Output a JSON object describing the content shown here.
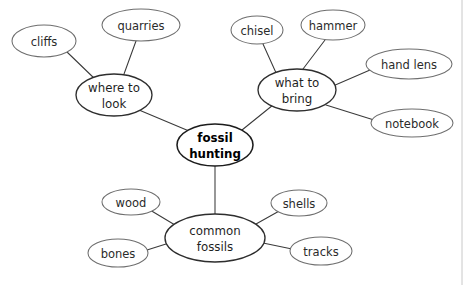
{
  "diagram": {
    "type": "mind-map",
    "title": "fossil hunting",
    "canvas": {
      "width": 471,
      "height": 285,
      "background": "#ffffff"
    },
    "styles": {
      "node_fill": "#ffffff",
      "leaf_stroke": "#6e6e6e",
      "branch_stroke": "#2e2e2e",
      "center_stroke": "#1c1c1c",
      "edge_stroke": "#3a3a3a",
      "text_color": "#1a1a1a",
      "frame_stroke": "#c8c8c8"
    },
    "center": {
      "id": "fossil-hunting",
      "label_line1": "fossil",
      "label_line2": "hunting",
      "cx": 215,
      "cy": 145,
      "rx": 38,
      "ry": 21
    },
    "branches": [
      {
        "id": "where-to-look",
        "label_line1": "where to",
        "label_line2": "look",
        "cx": 114,
        "cy": 95,
        "rx": 38,
        "ry": 21,
        "children": [
          {
            "id": "cliffs",
            "label": "cliffs",
            "cx": 44,
            "cy": 41,
            "rx": 32,
            "ry": 16
          },
          {
            "id": "quarries",
            "label": "quarries",
            "cx": 141,
            "cy": 25,
            "rx": 39,
            "ry": 16
          }
        ]
      },
      {
        "id": "what-to-bring",
        "label_line1": "what to",
        "label_line2": "bring",
        "cx": 297,
        "cy": 90,
        "rx": 39,
        "ry": 21,
        "children": [
          {
            "id": "chisel",
            "label": "chisel",
            "cx": 257,
            "cy": 30,
            "rx": 26,
            "ry": 14
          },
          {
            "id": "hammer",
            "label": "hammer",
            "cx": 333,
            "cy": 25,
            "rx": 32,
            "ry": 15
          },
          {
            "id": "hand-lens",
            "label": "hand lens",
            "cx": 409,
            "cy": 64,
            "rx": 43,
            "ry": 15
          },
          {
            "id": "notebook",
            "label": "notebook",
            "cx": 412,
            "cy": 123,
            "rx": 41,
            "ry": 14
          }
        ]
      },
      {
        "id": "common-fossils",
        "label_line1": "common",
        "label_line2": "fossils",
        "cx": 215,
        "cy": 238,
        "rx": 50,
        "ry": 24,
        "children": [
          {
            "id": "wood",
            "label": "wood",
            "cx": 131,
            "cy": 202,
            "rx": 29,
            "ry": 13
          },
          {
            "id": "bones",
            "label": "bones",
            "cx": 118,
            "cy": 253,
            "rx": 30,
            "ry": 14
          },
          {
            "id": "shells",
            "label": "shells",
            "cx": 299,
            "cy": 203,
            "rx": 28,
            "ry": 13
          },
          {
            "id": "tracks",
            "label": "tracks",
            "cx": 321,
            "cy": 251,
            "rx": 31,
            "ry": 14
          }
        ]
      }
    ],
    "edges": [
      {
        "from": "fossil-hunting",
        "to": "where-to-look",
        "x1": 189,
        "y1": 131,
        "x2": 139,
        "y2": 110
      },
      {
        "from": "fossil-hunting",
        "to": "what-to-bring",
        "x1": 242,
        "y1": 130,
        "x2": 273,
        "y2": 105
      },
      {
        "from": "fossil-hunting",
        "to": "common-fossils",
        "x1": 215,
        "y1": 166,
        "x2": 215,
        "y2": 214
      },
      {
        "from": "where-to-look",
        "to": "cliffs",
        "x1": 96,
        "y1": 80,
        "x2": 67,
        "y2": 52
      },
      {
        "from": "where-to-look",
        "to": "quarries",
        "x1": 124,
        "y1": 74,
        "x2": 136,
        "y2": 41
      },
      {
        "from": "what-to-bring",
        "to": "chisel",
        "x1": 277,
        "y1": 75,
        "x2": 263,
        "y2": 44
      },
      {
        "from": "what-to-bring",
        "to": "hammer",
        "x1": 303,
        "y1": 69,
        "x2": 325,
        "y2": 40
      },
      {
        "from": "what-to-bring",
        "to": "hand-lens",
        "x1": 333,
        "y1": 86,
        "x2": 370,
        "y2": 70
      },
      {
        "from": "what-to-bring",
        "to": "notebook",
        "x1": 326,
        "y1": 105,
        "x2": 374,
        "y2": 120
      },
      {
        "from": "common-fossils",
        "to": "wood",
        "x1": 175,
        "y1": 225,
        "x2": 150,
        "y2": 210
      },
      {
        "from": "common-fossils",
        "to": "bones",
        "x1": 166,
        "y1": 244,
        "x2": 147,
        "y2": 250
      },
      {
        "from": "common-fossils",
        "to": "shells",
        "x1": 256,
        "y1": 224,
        "x2": 281,
        "y2": 210
      },
      {
        "from": "common-fossils",
        "to": "tracks",
        "x1": 263,
        "y1": 243,
        "x2": 292,
        "y2": 249
      }
    ],
    "frame": {
      "right_line_x": 462,
      "top": 0,
      "bottom": 285
    }
  }
}
